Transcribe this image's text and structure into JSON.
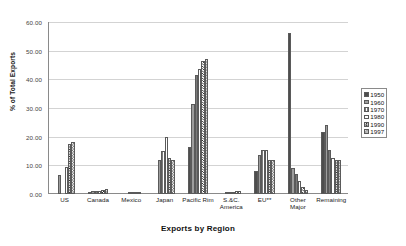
{
  "chart_data": {
    "type": "bar",
    "title": "",
    "xlabel": "Exports by Region",
    "ylabel": "% of Total Exports",
    "ylim": [
      0,
      60
    ],
    "ytick_labels": [
      "60.00",
      "50.00",
      "40.00",
      "30.00",
      "20.00",
      "10.00",
      "0.00"
    ],
    "ytick_values": [
      60,
      50,
      40,
      30,
      20,
      10,
      0
    ],
    "grid": true,
    "legend_position": "right",
    "categories": [
      "US",
      "Canada",
      "Mexico",
      "Japan",
      "Pacific Rim",
      "S.&C.\nAmerica",
      "EU**",
      "Other\nMajor",
      "Remaining"
    ],
    "category_labels": [
      {
        "line1": "US",
        "line2": ""
      },
      {
        "line1": "Canada",
        "line2": ""
      },
      {
        "line1": "Mexico",
        "line2": ""
      },
      {
        "line1": "Japan",
        "line2": ""
      },
      {
        "line1": "Pacific Rim",
        "line2": ""
      },
      {
        "line1": "S.&C.",
        "line2": "America"
      },
      {
        "line1": "EU**",
        "line2": ""
      },
      {
        "line1": "Other",
        "line2": "Major"
      },
      {
        "line1": "Remaining",
        "line2": ""
      }
    ],
    "series": [
      {
        "name": "1950",
        "swatch": "solid-dark",
        "color": "#4d4d4d",
        "values": [
          0.0,
          0.5,
          0.0,
          0.0,
          16.5,
          0.0,
          8.0,
          56.0,
          21.5
        ]
      },
      {
        "name": "1960",
        "swatch": "solid-gray",
        "color": "#9d9d9d",
        "values": [
          6.5,
          1.0,
          0.0,
          12.0,
          31.5,
          0.3,
          13.5,
          9.0,
          24.0
        ]
      },
      {
        "name": "1970",
        "swatch": "hatched",
        "color": "#7a7a7a",
        "values": [
          0.0,
          1.2,
          0.2,
          15.0,
          41.5,
          0.5,
          15.5,
          7.0,
          15.5
        ]
      },
      {
        "name": "1980",
        "swatch": "white-outline",
        "color": "#ffffff",
        "values": [
          9.5,
          1.0,
          0.3,
          20.0,
          43.5,
          0.8,
          15.5,
          4.5,
          12.5
        ]
      },
      {
        "name": "1990",
        "swatch": "checker-dark",
        "color": "#2b2b2b",
        "values": [
          17.5,
          1.5,
          0.5,
          12.5,
          46.5,
          1.0,
          12.0,
          2.5,
          12.0
        ]
      },
      {
        "name": "1997",
        "swatch": "checker-light",
        "color": "#6f6f6f",
        "values": [
          18.0,
          1.8,
          0.6,
          12.0,
          47.0,
          1.2,
          12.0,
          1.5,
          12.0
        ]
      }
    ],
    "legend_entries": [
      "1950",
      "1960",
      "1970",
      "1980",
      "1990",
      "1997"
    ]
  }
}
